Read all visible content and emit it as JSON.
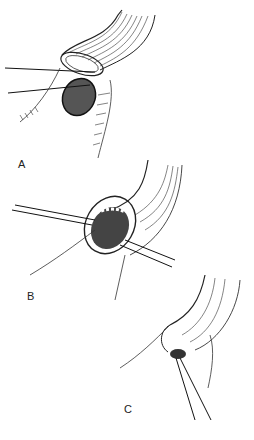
{
  "figure": {
    "type": "surgical line illustration",
    "panels": [
      {
        "id": "A",
        "label": "A",
        "description": "Everted bowel stoma with mucosal cuff; two sutures passing behind; cross-hatched oval opening below; sutured skin edge at left"
      },
      {
        "id": "B",
        "label": "B",
        "description": "Bowel end viewed obliquely showing interior mucosa with row of sutures; needle/suture lines crossing through edges"
      },
      {
        "id": "C",
        "label": "C",
        "description": "Completed anastomosis with interrupted sutures along margin; two suture ends trailing downward"
      }
    ]
  },
  "colors": {
    "background": "#ffffff",
    "ink": "#222222"
  }
}
